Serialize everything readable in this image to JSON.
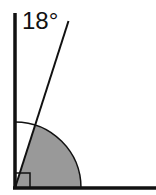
{
  "diagram": {
    "type": "angle-diagram",
    "angle_label": "18°",
    "angle_degrees": 18,
    "right_angle_marker": true,
    "shaded_sector": "between ray and baseline",
    "colors": {
      "line": "#111111",
      "shade": "#999999",
      "background": "#ffffff"
    }
  }
}
